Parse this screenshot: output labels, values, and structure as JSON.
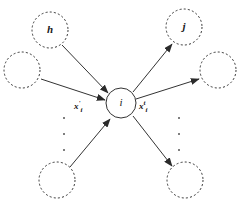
{
  "figure": {
    "background_color": "#ffffff",
    "stroke_color": "#333333",
    "text_color": "#1a1a1a"
  },
  "nodes": [
    {
      "id": "h",
      "label": "h",
      "style": "dashed",
      "cx": 50,
      "cy": 30,
      "r": 18,
      "font_size": 11,
      "name": "node-h"
    },
    {
      "id": "left_mid",
      "label": "",
      "style": "dashed",
      "cx": 22,
      "cy": 70,
      "r": 18,
      "font_size": 11,
      "name": "node-left-middle"
    },
    {
      "id": "bottom_left",
      "label": "",
      "style": "dashed",
      "cx": 57,
      "cy": 180,
      "r": 18,
      "font_size": 11,
      "name": "node-bottom-left"
    },
    {
      "id": "i",
      "label": "i",
      "style": "solid",
      "cx": 121,
      "cy": 103,
      "r": 15,
      "font_size": 11,
      "name": "node-i-center"
    },
    {
      "id": "j",
      "label": "j",
      "style": "dashed",
      "cx": 184,
      "cy": 27,
      "r": 18,
      "font_size": 11,
      "name": "node-j"
    },
    {
      "id": "right_mid",
      "label": "",
      "style": "dashed",
      "cx": 218,
      "cy": 70,
      "r": 18,
      "font_size": 11,
      "name": "node-right-middle"
    },
    {
      "id": "bottom_right",
      "label": "",
      "style": "dashed",
      "cx": 185,
      "cy": 180,
      "r": 18,
      "font_size": 11,
      "name": "node-bottom-right"
    }
  ],
  "edges": [
    {
      "id": "h_to_i",
      "from": "h",
      "to": "i",
      "direction": "incoming",
      "x1": 62,
      "y1": 45,
      "x2": 108,
      "y2": 93,
      "name": "edge-h-to-i"
    },
    {
      "id": "left_to_i",
      "from": "left_mid",
      "to": "i",
      "direction": "incoming",
      "x1": 41,
      "y1": 79,
      "x2": 105,
      "y2": 100,
      "name": "edge-left-to-i"
    },
    {
      "id": "bottomleft_to_i",
      "from": "bottom_left",
      "to": "i",
      "direction": "incoming",
      "x1": 70,
      "y1": 167,
      "x2": 110,
      "y2": 119,
      "name": "edge-bottomleft-to-i"
    },
    {
      "id": "i_to_j",
      "from": "i",
      "to": "j",
      "direction": "outgoing",
      "x1": 133,
      "y1": 92,
      "x2": 172,
      "y2": 44,
      "name": "edge-i-to-j"
    },
    {
      "id": "i_to_right",
      "from": "i",
      "to": "right_mid",
      "direction": "outgoing",
      "x1": 136,
      "y1": 99,
      "x2": 199,
      "y2": 79,
      "name": "edge-i-to-right"
    },
    {
      "id": "i_to_bottomright",
      "from": "i",
      "to": "bottom_right",
      "direction": "outgoing",
      "x1": 133,
      "y1": 116,
      "x2": 172,
      "y2": 166,
      "name": "edge-i-to-bottomright"
    }
  ],
  "edge_labels": {
    "incoming": {
      "text": "x'i",
      "var": "x",
      "superscript": "'",
      "subscript": "i",
      "x": 74,
      "y": 100,
      "name": "label-incoming-features"
    },
    "outgoing": {
      "text": "xti",
      "var": "x",
      "superscript": "t",
      "subscript": "i",
      "x": 139,
      "y": 100,
      "name": "label-outgoing-features"
    }
  },
  "ellipses": [
    {
      "id": "left_ellipsis",
      "x": 62,
      "y": 117,
      "height": 34,
      "dots": 3,
      "name": "ellipsis-left"
    },
    {
      "id": "right_ellipsis",
      "x": 177,
      "y": 117,
      "height": 34,
      "dots": 3,
      "name": "ellipsis-right"
    }
  ]
}
